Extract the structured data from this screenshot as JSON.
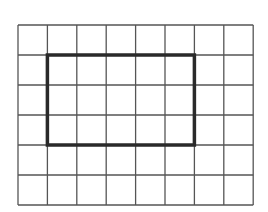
{
  "diagram": {
    "type": "grid-with-rectangle",
    "grid": {
      "columns": 8,
      "rows": 6,
      "origin_x": 18,
      "origin_y": 25,
      "cell_width": 29.4,
      "cell_height": 30,
      "line_color": "#555555",
      "line_width": 1.3
    },
    "rectangle": {
      "col_start": 1,
      "row_start": 1,
      "col_end": 6,
      "row_end": 4,
      "width_cells": 5,
      "height_cells": 3,
      "stroke_color": "#2a2a2a",
      "stroke_width": 3.5
    },
    "background": "#ffffff"
  }
}
